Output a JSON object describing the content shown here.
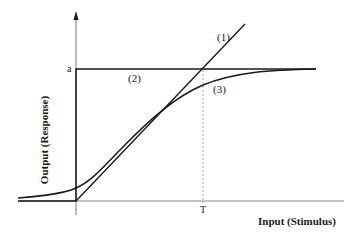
{
  "diagram": {
    "type": "stimulus-response curves",
    "y_axis": {
      "label": "Output (Response)",
      "marker": "a"
    },
    "x_axis": {
      "label": "Input (Stimulus)",
      "marker": "T"
    },
    "curves": [
      {
        "id": "1",
        "tag": "(1)",
        "description": "linear response, straight line through origin"
      },
      {
        "id": "2",
        "tag": "(2)",
        "description": "step response, jumps to level a"
      },
      {
        "id": "3",
        "tag": "(3)",
        "description": "saturating sigmoid-like response approaching a"
      }
    ],
    "colors": {
      "ink": "#1a1a1a",
      "guide": "#888888",
      "background": "#ffffff"
    }
  }
}
